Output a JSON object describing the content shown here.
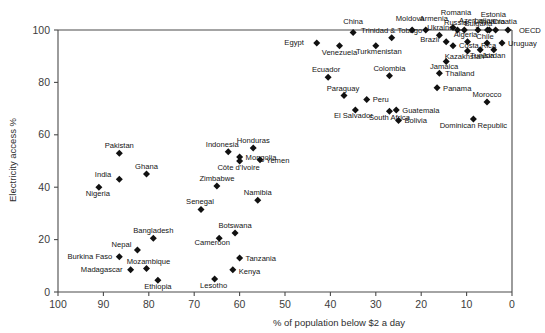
{
  "chart_data": {
    "type": "scatter",
    "title": "",
    "xlabel": "% of population below $2 a day",
    "ylabel": "Electricity access %",
    "xlim": [
      100,
      0
    ],
    "ylim": [
      0,
      100
    ],
    "x_axis_reversed": true,
    "grid": false,
    "legend": "none",
    "xticks": [
      100,
      90,
      80,
      70,
      60,
      50,
      40,
      30,
      20,
      10,
      0
    ],
    "yticks": [
      0,
      20,
      40,
      60,
      80,
      100
    ],
    "marker": "diamond",
    "marker_color": "#111111",
    "points": [
      {
        "label": "China",
        "x": 35.0,
        "y": 99.0,
        "lx": 0,
        "ly": -9,
        "anchor": "middle"
      },
      {
        "label": "Moldova",
        "x": 22.0,
        "y": 100.0,
        "lx": -2,
        "ly": -9,
        "anchor": "middle"
      },
      {
        "label": "Armenia",
        "x": 19.0,
        "y": 100.0,
        "lx": 8,
        "ly": -9,
        "anchor": "middle"
      },
      {
        "label": "Romania",
        "x": 13.0,
        "y": 101.0,
        "lx": 3,
        "ly": -12,
        "anchor": "middle"
      },
      {
        "label": "Russia",
        "x": 12.0,
        "y": 100.0,
        "lx": -2,
        "ly": -5,
        "anchor": "middle"
      },
      {
        "label": "Bulgaria",
        "x": 10.5,
        "y": 100.0,
        "lx": 14,
        "ly": -4,
        "anchor": "middle"
      },
      {
        "label": "Azerbaijan",
        "x": 7.5,
        "y": 100.0,
        "lx": -1,
        "ly": -7,
        "anchor": "middle"
      },
      {
        "label": "Lithuania",
        "x": 5.4,
        "y": 100.0,
        "lx": 2,
        "ly": -6,
        "anchor": "middle"
      },
      {
        "label": "Estonia",
        "x": 5.0,
        "y": 100.0,
        "lx": 4,
        "ly": -13,
        "anchor": "middle"
      },
      {
        "label": "Croatia",
        "x": 3.6,
        "y": 100.0,
        "lx": 9,
        "ly": -6,
        "anchor": "middle"
      },
      {
        "label": "OECD",
        "x": 0.9,
        "y": 100.0,
        "lx": 11,
        "ly": 3,
        "anchor": "start"
      },
      {
        "label": "Ukraine",
        "x": 16.0,
        "y": 98.0,
        "lx": 1,
        "ly": -5,
        "anchor": "middle"
      },
      {
        "label": "Egypt",
        "x": 43.0,
        "y": 95.0,
        "lx": -13,
        "ly": 2,
        "anchor": "end"
      },
      {
        "label": "Trinidad & Tobago",
        "x": 26.5,
        "y": 97.0,
        "lx": 0,
        "ly": -5,
        "anchor": "middle"
      },
      {
        "label": "Venezuela",
        "x": 38.0,
        "y": 94.0,
        "lx": 0,
        "ly": 9,
        "anchor": "middle"
      },
      {
        "label": "Turkmenistan",
        "x": 30.0,
        "y": 94.0,
        "lx": 3,
        "ly": 8,
        "anchor": "middle"
      },
      {
        "label": "Brazil",
        "x": 14.5,
        "y": 95.5,
        "lx": -7,
        "ly": 0,
        "anchor": "end"
      },
      {
        "label": "Algeria",
        "x": 9.8,
        "y": 95.5,
        "lx": -2,
        "ly": -5,
        "anchor": "middle"
      },
      {
        "label": "Costa Rica",
        "x": 13.0,
        "y": 94.0,
        "lx": 6,
        "ly": 2,
        "anchor": "start"
      },
      {
        "label": "Kazakhstan",
        "x": 9.8,
        "y": 92.0,
        "lx": -3,
        "ly": 8,
        "anchor": "middle"
      },
      {
        "label": "Tunisia",
        "x": 7.0,
        "y": 92.5,
        "lx": 2,
        "ly": 8,
        "anchor": "middle"
      },
      {
        "label": "Chile",
        "x": 5.5,
        "y": 95.0,
        "lx": -2,
        "ly": -4,
        "anchor": "middle"
      },
      {
        "label": "Jordan",
        "x": 4.0,
        "y": 92.5,
        "lx": 0,
        "ly": 8,
        "anchor": "middle"
      },
      {
        "label": "Uruguay",
        "x": 2.2,
        "y": 95.0,
        "lx": 6,
        "ly": 3,
        "anchor": "start"
      },
      {
        "label": "Jamaica",
        "x": 14.5,
        "y": 88.0,
        "lx": -2,
        "ly": 8,
        "anchor": "middle"
      },
      {
        "label": "Ecuador",
        "x": 40.5,
        "y": 82.0,
        "lx": -2,
        "ly": -5,
        "anchor": "middle"
      },
      {
        "label": "Colombia",
        "x": 27.0,
        "y": 82.5,
        "lx": 0,
        "ly": -5,
        "anchor": "middle"
      },
      {
        "label": "Thailand",
        "x": 16.0,
        "y": 83.5,
        "lx": 6,
        "ly": 3,
        "anchor": "start"
      },
      {
        "label": "Panama",
        "x": 16.5,
        "y": 78.0,
        "lx": 6,
        "ly": 3,
        "anchor": "start"
      },
      {
        "label": "Paraguay",
        "x": 37.0,
        "y": 75.0,
        "lx": -1,
        "ly": -5,
        "anchor": "middle"
      },
      {
        "label": "Peru",
        "x": 32.0,
        "y": 73.5,
        "lx": 6,
        "ly": 3,
        "anchor": "start"
      },
      {
        "label": "Morocco",
        "x": 5.5,
        "y": 72.5,
        "lx": 0,
        "ly": -5,
        "anchor": "middle"
      },
      {
        "label": "El Salvador",
        "x": 34.5,
        "y": 69.5,
        "lx": -2,
        "ly": 8,
        "anchor": "middle"
      },
      {
        "label": "Guatemala",
        "x": 25.5,
        "y": 69.5,
        "lx": 6,
        "ly": 3,
        "anchor": "start"
      },
      {
        "label": "South Africa",
        "x": 27.0,
        "y": 69.0,
        "lx": 0,
        "ly": 9,
        "anchor": "middle"
      },
      {
        "label": "Bolivia",
        "x": 25.0,
        "y": 65.5,
        "lx": 6,
        "ly": 3,
        "anchor": "start"
      },
      {
        "label": "Dominican Republic",
        "x": 8.5,
        "y": 66.0,
        "lx": 0,
        "ly": 9,
        "anchor": "middle"
      },
      {
        "label": "Pakistan",
        "x": 86.5,
        "y": 53.0,
        "lx": 0,
        "ly": -5,
        "anchor": "middle"
      },
      {
        "label": "Indonesia",
        "x": 62.5,
        "y": 53.5,
        "lx": -6,
        "ly": -5,
        "anchor": "middle"
      },
      {
        "label": "Mongolia",
        "x": 60.0,
        "y": 51.5,
        "lx": 6,
        "ly": 3,
        "anchor": "start"
      },
      {
        "label": "Honduras",
        "x": 57.0,
        "y": 55.0,
        "lx": 0,
        "ly": -5,
        "anchor": "middle"
      },
      {
        "label": "Yemen",
        "x": 55.5,
        "y": 50.5,
        "lx": 6,
        "ly": 3,
        "anchor": "start"
      },
      {
        "label": "Côte d'Ivoire",
        "x": 60.0,
        "y": 50.0,
        "lx": -1,
        "ly": 9,
        "anchor": "middle"
      },
      {
        "label": "Ghana",
        "x": 80.5,
        "y": 45.0,
        "lx": 0,
        "ly": -5,
        "anchor": "middle"
      },
      {
        "label": "India",
        "x": 86.5,
        "y": 43.0,
        "lx": -8,
        "ly": -2,
        "anchor": "end"
      },
      {
        "label": "Zimbabwe",
        "x": 65.0,
        "y": 40.5,
        "lx": 0,
        "ly": -5,
        "anchor": "middle"
      },
      {
        "label": "Nigeria",
        "x": 91.0,
        "y": 40.0,
        "lx": -1,
        "ly": 9,
        "anchor": "middle"
      },
      {
        "label": "Namibia",
        "x": 56.0,
        "y": 35.0,
        "lx": 0,
        "ly": -5,
        "anchor": "middle"
      },
      {
        "label": "Senegal",
        "x": 68.5,
        "y": 31.5,
        "lx": -1,
        "ly": -5,
        "anchor": "middle"
      },
      {
        "label": "Botswana",
        "x": 61.0,
        "y": 22.5,
        "lx": 0,
        "ly": -5,
        "anchor": "middle"
      },
      {
        "label": "Bangladesh",
        "x": 79.0,
        "y": 20.5,
        "lx": 0,
        "ly": -5,
        "anchor": "middle"
      },
      {
        "label": "Cameroon",
        "x": 64.5,
        "y": 20.5,
        "lx": -7,
        "ly": 7,
        "anchor": "middle"
      },
      {
        "label": "Nepal",
        "x": 82.5,
        "y": 16.0,
        "lx": -6,
        "ly": -3,
        "anchor": "end"
      },
      {
        "label": "Tanzania",
        "x": 60.0,
        "y": 13.0,
        "lx": 6,
        "ly": 3,
        "anchor": "start"
      },
      {
        "label": "Burkina Faso",
        "x": 86.5,
        "y": 13.5,
        "lx": -7,
        "ly": 2,
        "anchor": "end"
      },
      {
        "label": "Mozambique",
        "x": 80.5,
        "y": 9.0,
        "lx": 2,
        "ly": -4,
        "anchor": "middle"
      },
      {
        "label": "Madagascar",
        "x": 84.0,
        "y": 8.5,
        "lx": -8,
        "ly": 2,
        "anchor": "end"
      },
      {
        "label": "Kenya",
        "x": 61.5,
        "y": 8.5,
        "lx": 6,
        "ly": 4,
        "anchor": "start"
      },
      {
        "label": "Lesotho",
        "x": 65.5,
        "y": 5.0,
        "lx": -1,
        "ly": 9,
        "anchor": "middle"
      },
      {
        "label": "Ethiopia",
        "x": 78.0,
        "y": 4.5,
        "lx": 0,
        "ly": 9,
        "anchor": "middle"
      }
    ]
  }
}
